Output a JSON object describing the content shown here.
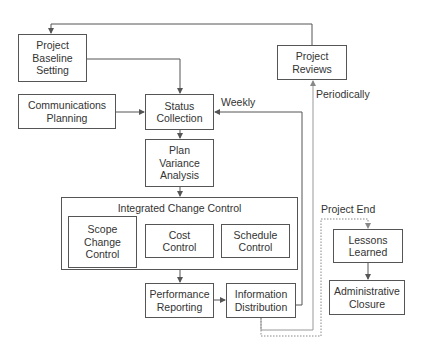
{
  "nodes": {
    "baseline": "Project\nBaseline\nSetting",
    "comms": "Communications\nPlanning",
    "status": "Status\nCollection",
    "variance": "Plan\nVariance\nAnalysis",
    "integrated_title": "Integrated Change Control",
    "scope": "Scope\nChange\nControl",
    "cost": "Cost\nControl",
    "schedule": "Schedule\nControl",
    "performance": "Performance\nReporting",
    "info": "Information\nDistribution",
    "reviews": "Project\nReviews",
    "lessons": "Lessons\nLearned",
    "closure": "Administrative\nClosure"
  },
  "edge_labels": {
    "weekly": "Weekly",
    "periodically": "Periodically",
    "project_end": "Project End"
  },
  "colors": {
    "line": "#555555",
    "light_line": "#999999"
  }
}
